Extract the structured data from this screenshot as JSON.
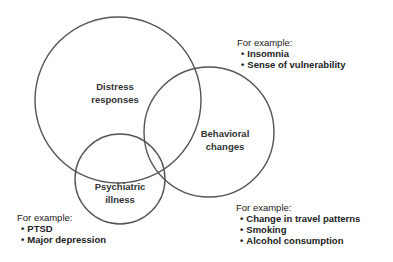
{
  "diagram": {
    "type": "venn",
    "stroke_color": "#555555",
    "circles": [
      {
        "id": "distress",
        "label_lines": [
          "Distress",
          "responses"
        ],
        "cx": 118,
        "cy": 100,
        "r": 83
      },
      {
        "id": "behavioral",
        "label_lines": [
          "Behavioral",
          "changes"
        ],
        "cx": 209,
        "cy": 132,
        "r": 65
      },
      {
        "id": "psychiatric",
        "label_lines": [
          "Psychiatric",
          "illness"
        ],
        "cx": 120,
        "cy": 179,
        "r": 45
      }
    ],
    "annotations": [
      {
        "for": "distress",
        "heading": "For example:",
        "items": [
          "Insomnia",
          "Sense of vulnerability"
        ]
      },
      {
        "for": "behavioral",
        "heading": "For example:",
        "items": [
          "Change in travel patterns",
          "Smoking",
          "Alcohol consumption"
        ]
      },
      {
        "for": "psychiatric",
        "heading": "For example:",
        "items": [
          "PTSD",
          "Major depression"
        ]
      }
    ]
  }
}
